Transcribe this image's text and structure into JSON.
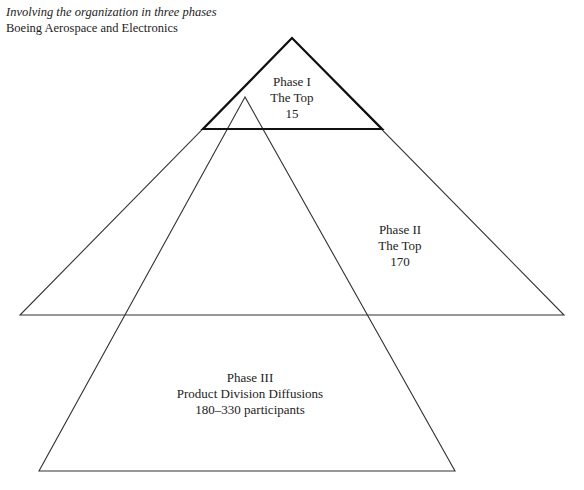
{
  "caption": {
    "subtitle": "Involving the organization in three phases",
    "title": "Boeing Aerospace and Electronics"
  },
  "phases": [
    {
      "name": "Phase I",
      "group": "The Top",
      "count": "15"
    },
    {
      "name": "Phase II",
      "group": "The Top",
      "count": "170"
    },
    {
      "name": "Phase III",
      "group": "Product Division Diffusions",
      "count": "180–330 participants"
    }
  ],
  "colors": {
    "line": "#222222",
    "background": "#ffffff"
  }
}
